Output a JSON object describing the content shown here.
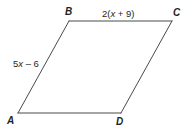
{
  "figure": {
    "type": "parallelogram",
    "name": "parallelogram-abcd",
    "background_color": "#ffffff",
    "stroke_color": "#4a4a4a",
    "stroke_width": 1,
    "text_color": "#231f20",
    "vertices": [
      {
        "name": "A",
        "label": "A",
        "x": 18,
        "y": 113
      },
      {
        "name": "B",
        "label": "B",
        "x": 69,
        "y": 21
      },
      {
        "name": "C",
        "label": "C",
        "x": 172,
        "y": 21
      },
      {
        "name": "D",
        "label": "D",
        "x": 121,
        "y": 113
      }
    ],
    "edges": [
      {
        "name": "edge-ab",
        "from": "A",
        "to": "B"
      },
      {
        "name": "edge-bc",
        "from": "B",
        "to": "C"
      },
      {
        "name": "edge-cd",
        "from": "C",
        "to": "D"
      },
      {
        "name": "edge-da",
        "from": "D",
        "to": "A"
      }
    ],
    "side_labels": [
      {
        "name": "side-label-bc",
        "edge": "edge-bc",
        "prefix": "2(",
        "variable": "x",
        "suffix": " + 9)",
        "full_text": "2(x + 9)"
      },
      {
        "name": "side-label-ab",
        "edge": "edge-ab",
        "prefix": "5",
        "variable": "x",
        "suffix": " – 6",
        "full_text": "5x – 6"
      }
    ]
  }
}
